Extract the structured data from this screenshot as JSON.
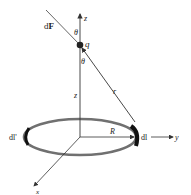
{
  "diagram": {
    "title": "",
    "labels": {
      "axis_z": "z",
      "axis_y": "y",
      "axis_x": "x",
      "force": "dF",
      "force_prefix": "d",
      "force_symbol": "F",
      "charge": "q",
      "theta_top": "θ",
      "theta_bottom": "θ",
      "height": "z",
      "distance": "r",
      "radius": "R",
      "element_right": "dl",
      "element_left": "dl'"
    },
    "colors": {
      "ring": "#707070",
      "line": "#333333",
      "element": "#111111"
    }
  }
}
